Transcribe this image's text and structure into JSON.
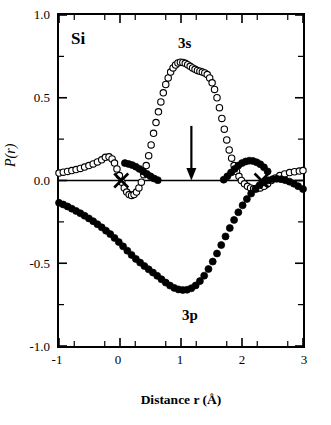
{
  "chart_data": {
    "type": "scatter",
    "title": "",
    "element_label": "Si",
    "xlabel": "Distance r (Å)",
    "ylabel": "P(r)",
    "xlim": [
      -1,
      3
    ],
    "ylim": [
      -1.0,
      1.0
    ],
    "xticks": [
      -1,
      0,
      1,
      2,
      3
    ],
    "xticklabels": [
      "-1",
      "0",
      "1",
      "2",
      "3"
    ],
    "yticks": [
      -1.0,
      -0.5,
      0.0,
      0.5,
      1.0
    ],
    "yticklabels": [
      "-1.0",
      "-0.5",
      "0.0",
      "0.5",
      "1.0"
    ],
    "grid": false,
    "legend": "none",
    "annotations": [
      {
        "name": "label-3s",
        "text": "3s",
        "x": 1.05,
        "y": 0.87
      },
      {
        "name": "label-3p",
        "text": "3p",
        "x": 1.12,
        "y": -0.78
      },
      {
        "name": "label-si",
        "text": "Si",
        "x": -0.78,
        "y": 0.88
      },
      {
        "name": "arrow-marker",
        "text": "",
        "x": 1.17,
        "y": 0.25
      },
      {
        "name": "cross-marker-left",
        "text": "x",
        "x": 0.02,
        "y": 0.0
      },
      {
        "name": "cross-marker-right",
        "text": "x",
        "x": 2.32,
        "y": 0.0
      }
    ],
    "series": [
      {
        "name": "3s",
        "marker": "open-circle",
        "color": "#000000",
        "points": [
          [
            -1.0,
            0.045
          ],
          [
            -0.93,
            0.05
          ],
          [
            -0.86,
            0.055
          ],
          [
            -0.79,
            0.06
          ],
          [
            -0.72,
            0.066
          ],
          [
            -0.65,
            0.073
          ],
          [
            -0.58,
            0.081
          ],
          [
            -0.51,
            0.09
          ],
          [
            -0.44,
            0.1
          ],
          [
            -0.37,
            0.112
          ],
          [
            -0.3,
            0.125
          ],
          [
            -0.24,
            0.14
          ],
          [
            -0.18,
            0.143
          ],
          [
            -0.13,
            0.13
          ],
          [
            -0.09,
            0.105
          ],
          [
            -0.05,
            0.07
          ],
          [
            -0.01,
            0.03
          ],
          [
            0.03,
            -0.01
          ],
          [
            0.07,
            -0.045
          ],
          [
            0.11,
            -0.07
          ],
          [
            0.15,
            -0.085
          ],
          [
            0.19,
            -0.09
          ],
          [
            0.23,
            -0.085
          ],
          [
            0.27,
            -0.07
          ],
          [
            0.31,
            -0.045
          ],
          [
            0.35,
            -0.01
          ],
          [
            0.39,
            0.035
          ],
          [
            0.43,
            0.09
          ],
          [
            0.47,
            0.15
          ],
          [
            0.51,
            0.215
          ],
          [
            0.55,
            0.285
          ],
          [
            0.59,
            0.35
          ],
          [
            0.63,
            0.415
          ],
          [
            0.67,
            0.475
          ],
          [
            0.71,
            0.53
          ],
          [
            0.75,
            0.58
          ],
          [
            0.79,
            0.62
          ],
          [
            0.83,
            0.655
          ],
          [
            0.87,
            0.68
          ],
          [
            0.91,
            0.698
          ],
          [
            0.95,
            0.71
          ],
          [
            0.99,
            0.715
          ],
          [
            1.03,
            0.713
          ],
          [
            1.07,
            0.708
          ],
          [
            1.11,
            0.7
          ],
          [
            1.15,
            0.69
          ],
          [
            1.19,
            0.68
          ],
          [
            1.23,
            0.672
          ],
          [
            1.27,
            0.665
          ],
          [
            1.31,
            0.66
          ],
          [
            1.35,
            0.655
          ],
          [
            1.39,
            0.65
          ],
          [
            1.43,
            0.64
          ],
          [
            1.47,
            0.62
          ],
          [
            1.51,
            0.59
          ],
          [
            1.55,
            0.55
          ],
          [
            1.59,
            0.5
          ],
          [
            1.63,
            0.44
          ],
          [
            1.67,
            0.375
          ],
          [
            1.71,
            0.31
          ],
          [
            1.75,
            0.245
          ],
          [
            1.79,
            0.185
          ],
          [
            1.83,
            0.135
          ],
          [
            1.87,
            0.09
          ],
          [
            1.91,
            0.055
          ],
          [
            1.95,
            0.025
          ],
          [
            1.99,
            0.0
          ],
          [
            2.04,
            -0.02
          ],
          [
            2.09,
            -0.035
          ],
          [
            2.14,
            -0.045
          ],
          [
            2.19,
            -0.05
          ],
          [
            2.24,
            -0.05
          ],
          [
            2.3,
            -0.045
          ],
          [
            2.36,
            -0.035
          ],
          [
            2.42,
            -0.02
          ],
          [
            2.48,
            0.0
          ],
          [
            2.55,
            0.015
          ],
          [
            2.62,
            0.03
          ],
          [
            2.7,
            0.04
          ],
          [
            2.78,
            0.048
          ],
          [
            2.86,
            0.053
          ],
          [
            2.94,
            0.057
          ],
          [
            3.0,
            0.06
          ]
        ]
      },
      {
        "name": "3p",
        "marker": "filled-circle",
        "color": "#000000",
        "points": [
          [
            -1.0,
            -0.135
          ],
          [
            -0.93,
            -0.145
          ],
          [
            -0.86,
            -0.157
          ],
          [
            -0.79,
            -0.17
          ],
          [
            -0.72,
            -0.184
          ],
          [
            -0.65,
            -0.198
          ],
          [
            -0.58,
            -0.213
          ],
          [
            -0.51,
            -0.229
          ],
          [
            -0.44,
            -0.246
          ],
          [
            -0.37,
            -0.264
          ],
          [
            -0.3,
            -0.283
          ],
          [
            -0.23,
            -0.303
          ],
          [
            -0.16,
            -0.324
          ],
          [
            -0.09,
            -0.347
          ],
          [
            -0.02,
            -0.372
          ],
          [
            0.05,
            -0.398
          ],
          [
            0.12,
            -0.424
          ],
          [
            0.19,
            -0.45
          ],
          [
            0.26,
            -0.474
          ],
          [
            0.33,
            -0.496
          ],
          [
            0.4,
            -0.517
          ],
          [
            0.47,
            -0.537
          ],
          [
            0.54,
            -0.556
          ],
          [
            0.61,
            -0.576
          ],
          [
            0.68,
            -0.597
          ],
          [
            0.75,
            -0.617
          ],
          [
            0.82,
            -0.635
          ],
          [
            0.89,
            -0.649
          ],
          [
            0.96,
            -0.658
          ],
          [
            1.03,
            -0.662
          ],
          [
            1.1,
            -0.66
          ],
          [
            1.17,
            -0.651
          ],
          [
            1.24,
            -0.634
          ],
          [
            1.31,
            -0.608
          ],
          [
            1.38,
            -0.575
          ],
          [
            1.45,
            -0.535
          ],
          [
            1.52,
            -0.49
          ],
          [
            1.59,
            -0.441
          ],
          [
            1.66,
            -0.39
          ],
          [
            1.73,
            -0.338
          ],
          [
            1.8,
            -0.287
          ],
          [
            1.87,
            -0.238
          ],
          [
            1.94,
            -0.192
          ],
          [
            2.01,
            -0.15
          ],
          [
            2.08,
            -0.112
          ],
          [
            2.15,
            -0.079
          ],
          [
            2.22,
            -0.051
          ],
          [
            2.29,
            -0.028
          ],
          [
            2.36,
            -0.011
          ],
          [
            2.43,
            0.001
          ],
          [
            2.5,
            0.008
          ],
          [
            2.57,
            0.01
          ],
          [
            2.64,
            0.008
          ],
          [
            2.71,
            0.002
          ],
          [
            2.78,
            -0.007
          ],
          [
            2.85,
            -0.019
          ],
          [
            2.92,
            -0.034
          ],
          [
            3.0,
            -0.052
          ],
          [
            0.08,
            0.105
          ],
          [
            0.14,
            0.1
          ],
          [
            0.2,
            0.093
          ],
          [
            0.26,
            0.083
          ],
          [
            0.32,
            0.07
          ],
          [
            0.38,
            0.055
          ],
          [
            0.44,
            0.04
          ],
          [
            0.5,
            0.025
          ],
          [
            0.56,
            0.012
          ],
          [
            0.62,
            0.002
          ],
          [
            2.42,
            0.055
          ],
          [
            2.36,
            0.08
          ],
          [
            2.3,
            0.098
          ],
          [
            2.24,
            0.11
          ],
          [
            2.18,
            0.118
          ],
          [
            2.12,
            0.12
          ],
          [
            2.06,
            0.115
          ],
          [
            2.0,
            0.105
          ],
          [
            1.94,
            0.09
          ],
          [
            1.88,
            0.07
          ],
          [
            1.82,
            0.048
          ],
          [
            1.76,
            0.025
          ],
          [
            1.7,
            0.005
          ]
        ]
      }
    ]
  }
}
